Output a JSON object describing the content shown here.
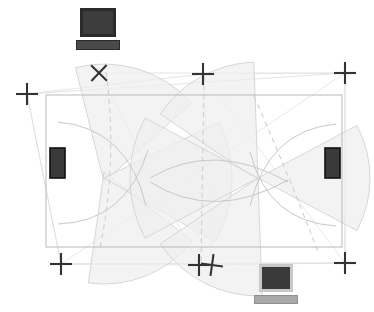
{
  "diagram": {
    "background_color": "#ffffff",
    "canvas": {
      "width": 374,
      "height": 312
    }
  },
  "colors": {
    "marker_cross": "#333333",
    "sensor_dark": "#3a3a3a",
    "sensor_border": "#111111",
    "outline_gray": "#b9b9b9",
    "outline_light": "#d8d8d8",
    "fan_fill": "#efefef",
    "fan_stroke": "#d2d2d2",
    "arc_stroke": "#c8c8c8",
    "dashed_stroke": "#cfcfcf",
    "pc_screen_top": "#3d3d3d",
    "pc_screen_bottom": "#3a3a3a",
    "pc_bezel_bottom": "#c9c9c9",
    "pc_base_top": "#4a4a4a",
    "pc_base_bottom": "#a9a9a9"
  },
  "main_rectangle": {
    "name": "coverage-area-rectangle",
    "x": 46,
    "y": 95,
    "width": 296,
    "height": 152,
    "stroke": "#b9b9b9",
    "fill": "none"
  },
  "computers": [
    {
      "id": "computer-top",
      "label": "workstation-top",
      "x": 76,
      "y": 8,
      "screen": {
        "w": 36,
        "h": 29,
        "fill": "#3d3d3d",
        "border": "#2a2a2a"
      },
      "base": {
        "w": 44,
        "h": 10,
        "fill": "#4a4a4a",
        "border": "#2a2a2a"
      },
      "style": "dark"
    },
    {
      "id": "computer-bottom",
      "label": "workstation-bottom",
      "x": 254,
      "y": 264,
      "screen": {
        "w": 34,
        "h": 28,
        "fill": "#3a3a3a",
        "border": "#c9c9c9"
      },
      "base": {
        "w": 44,
        "h": 9,
        "fill": "#a9a9a9",
        "border": "#909090"
      },
      "style": "light"
    }
  ],
  "sensors": [
    {
      "id": "sensor-left",
      "label": "sensor-node-left",
      "x": 50,
      "y": 148,
      "width": 15,
      "height": 30,
      "fill": "#3a3a3a",
      "border": "#111111"
    },
    {
      "id": "sensor-right",
      "label": "sensor-node-right",
      "x": 325,
      "y": 148,
      "width": 15,
      "height": 30,
      "fill": "#3a3a3a",
      "border": "#111111"
    }
  ],
  "cross_markers": [
    {
      "id": "cross-top-left",
      "x": 27,
      "y": 94,
      "size": 22,
      "rotation": 0,
      "stroke_width": 2.1
    },
    {
      "id": "cross-top-mid-left",
      "x": 99,
      "y": 73,
      "size": 22,
      "rotation": 44,
      "stroke_width": 2.1
    },
    {
      "id": "cross-top-mid-right",
      "x": 203,
      "y": 74,
      "size": 22,
      "rotation": 0,
      "stroke_width": 2.1
    },
    {
      "id": "cross-top-right",
      "x": 345,
      "y": 73,
      "size": 22,
      "rotation": 0,
      "stroke_width": 2.1
    },
    {
      "id": "cross-bottom-left",
      "x": 61,
      "y": 264,
      "size": 22,
      "rotation": 0,
      "stroke_width": 2.1
    },
    {
      "id": "cross-bottom-mid-a",
      "x": 199,
      "y": 265,
      "size": 22,
      "rotation": 0,
      "stroke_width": 2.1
    },
    {
      "id": "cross-bottom-mid-b",
      "x": 212,
      "y": 265,
      "size": 22,
      "rotation": 8,
      "stroke_width": 2.1
    },
    {
      "id": "cross-bottom-right",
      "x": 345,
      "y": 263,
      "size": 22,
      "rotation": 0,
      "stroke_width": 2.1
    }
  ],
  "outline_quads": [
    {
      "id": "quad-outer-skew-a",
      "points": "27,94 345,73 345,263 61,264",
      "stroke": "#dcdcdc"
    },
    {
      "id": "quad-outer-skew-b",
      "points": "99,73 345,73 345,263 199,265",
      "stroke": "#dedede"
    },
    {
      "id": "quad-outer-skew-c",
      "points": "27,94 203,74 212,265 61,264",
      "stroke": "#dedede"
    },
    {
      "id": "quad-outer-skew-d",
      "points": "61,264 345,73 203,74 345,263",
      "stroke": "#e2e2e2"
    }
  ],
  "fan_sectors": [
    {
      "id": "fan-left-upper",
      "cx": 104,
      "cy": 182,
      "r": 118,
      "a0": 256,
      "a1": 318
    },
    {
      "id": "fan-left-lower",
      "cx": 104,
      "cy": 172,
      "r": 112,
      "a0": 38,
      "a1": 98
    },
    {
      "id": "fan-left-right",
      "cx": 104,
      "cy": 178,
      "r": 128,
      "a0": -26,
      "a1": 30
    },
    {
      "id": "fan-mid-upper",
      "cx": 258,
      "cy": 180,
      "r": 118,
      "a0": 214,
      "a1": 268
    },
    {
      "id": "fan-mid-lower",
      "cx": 258,
      "cy": 178,
      "r": 118,
      "a0": 88,
      "a1": 146
    },
    {
      "id": "fan-right-left",
      "cx": 258,
      "cy": 178,
      "r": 128,
      "a0": 152,
      "a1": 208
    },
    {
      "id": "fan-right-side",
      "cx": 258,
      "cy": 178,
      "r": 112,
      "a0": -28,
      "a1": 28
    }
  ],
  "arcs": [
    {
      "id": "arc-left-top",
      "d": "M 58 122 Q 128 128 146 206"
    },
    {
      "id": "arc-left-bottom",
      "d": "M 58 224 Q 126 222 148 150"
    },
    {
      "id": "arc-mid-top",
      "d": "M 150 178 Q 214 140 288 182"
    },
    {
      "id": "arc-mid-bottom",
      "d": "M 150 182 Q 214 222 288 180"
    },
    {
      "id": "arc-right-top",
      "d": "M 336 124 Q 268 130 250 206"
    },
    {
      "id": "arc-right-bottom",
      "d": "M 336 226 Q 268 222 250 152"
    }
  ],
  "dashed_paths": [
    {
      "id": "dash-left",
      "d": "M 106 72 Q 118 160 100 248"
    },
    {
      "id": "dash-right",
      "d": "M 254 96 Q 290 178 318 252"
    },
    {
      "id": "dash-center",
      "d": "M 204 76 L 201 266"
    }
  ],
  "legend": {
    "visible": false,
    "items": []
  }
}
